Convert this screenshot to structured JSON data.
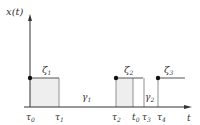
{
  "diagram": {
    "y_axis_label": "x(t)",
    "x_axis_label": "t",
    "tick_labels": [
      {
        "text": "τ",
        "sub": "0",
        "x": 30
      },
      {
        "text": "τ",
        "sub": "1",
        "x": 59
      },
      {
        "text": "τ",
        "sub": "2",
        "x": 116
      },
      {
        "text": "t",
        "sub": "0",
        "x": 134
      },
      {
        "text": "τ",
        "sub": "3",
        "x": 146
      },
      {
        "text": "τ",
        "sub": "4",
        "x": 161
      }
    ],
    "level_labels": [
      {
        "text": "ζ",
        "sub": "1",
        "x": 42,
        "y": 80
      },
      {
        "text": "ζ",
        "sub": "2",
        "x": 125,
        "y": 80
      },
      {
        "text": "ζ",
        "sub": "3",
        "x": 166,
        "y": 80
      }
    ],
    "gap_labels": [
      {
        "text": "γ",
        "sub": "1",
        "x": 83,
        "y": 100
      },
      {
        "text": "γ",
        "sub": "2",
        "x": 145,
        "y": 100
      }
    ],
    "colors": {
      "axis": "#333333",
      "line": "#555555",
      "shade": "#eeeeee",
      "dot": "#111111"
    }
  }
}
